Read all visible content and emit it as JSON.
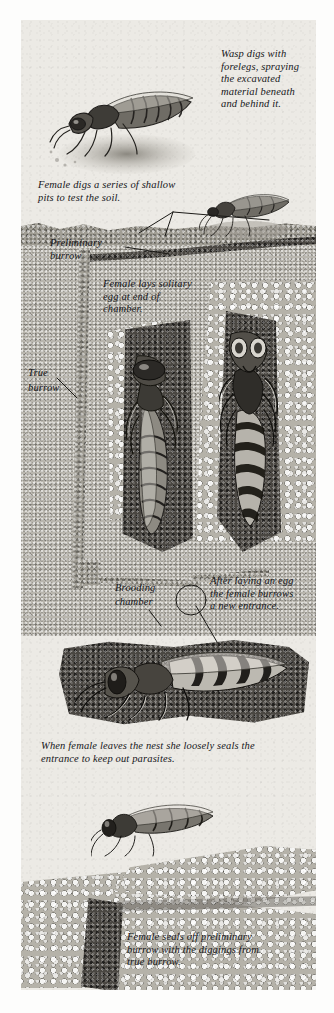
{
  "illustration": {
    "subject": "digger wasp nest-building sequence",
    "style": "pen-and-ink wash natural history plate",
    "captions": {
      "c1": "Wasp digs with\nforelegs, spraying\nthe excavated\nmaterial beneath\nand behind it.",
      "c2": "Female digs a series of shallow\npits to test the soil.",
      "c3_line1": "Preliminary",
      "c3_line2": "burrow",
      "c4": "Female  lays  solitary\negg at end of\nchamber.",
      "c5_line1": "True",
      "c5_line2": "burrow",
      "c6_line1": "Brooding",
      "c6_line2": "chamber",
      "c7": "After laying an egg\nthe female burrows\na new entrance.",
      "c8": "When female leaves the nest she loosely seals the\nentrance to keep out parasites.",
      "c9": "Female  seals  off  preliminary\nburrow with the diggings from\ntrue burrow."
    },
    "labels": {
      "wasp_digging": "wasp-digging-surface",
      "wasp_testing_pits": "wasp-testing-pits",
      "wasp_in_chamber_side": "wasp-in-brooding-chamber-side-view",
      "wasp_in_burrow_front": "wasp-in-burrow-front-view",
      "wasp_new_entrance": "wasp-digging-new-entrance",
      "wasp_sealing": "wasp-sealing-entrance"
    },
    "colors": {
      "paper": "#eceae5",
      "ink": "#16161a",
      "soil_surface": "#a09d94",
      "soil_fine": "#b9b6ae",
      "soil_dark": "#4a4742",
      "pebble": "#b5b2a9"
    }
  }
}
